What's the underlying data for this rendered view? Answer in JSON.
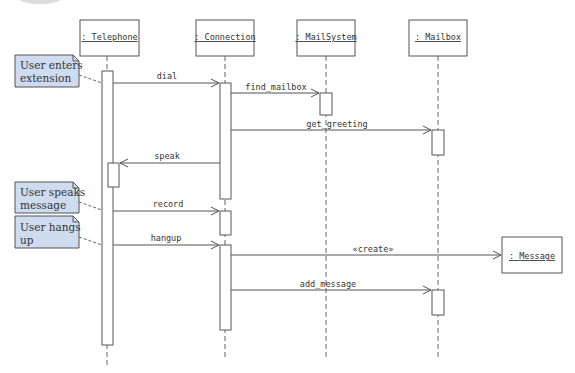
{
  "diagram": {
    "type": "UML sequence diagram",
    "objects": [
      {
        "id": "telephone",
        "label": ": Telephone"
      },
      {
        "id": "connection",
        "label": ": Connection"
      },
      {
        "id": "mailsystem",
        "label": ": MailSystem"
      },
      {
        "id": "mailbox",
        "label": ": Mailbox"
      },
      {
        "id": "message",
        "label": ": Message"
      }
    ],
    "messages": [
      {
        "label": "dial",
        "from": "telephone",
        "to": "connection"
      },
      {
        "label": "find_mailbox",
        "from": "connection",
        "to": "mailsystem"
      },
      {
        "label": "get_greeting",
        "from": "connection",
        "to": "mailbox"
      },
      {
        "label": "speak",
        "from": "connection",
        "to": "telephone"
      },
      {
        "label": "record",
        "from": "telephone",
        "to": "connection"
      },
      {
        "label": "hangup",
        "from": "telephone",
        "to": "connection"
      },
      {
        "label": "«create»",
        "from": "connection",
        "to": "message"
      },
      {
        "label": "add_message",
        "from": "connection",
        "to": "mailbox"
      }
    ],
    "notes": [
      {
        "lines": [
          "User enters",
          "extension"
        ],
        "attached_to": "dial"
      },
      {
        "lines": [
          "User speaks",
          "message"
        ],
        "attached_to": "record"
      },
      {
        "lines": [
          "User hangs",
          "up"
        ],
        "attached_to": "hangup"
      }
    ],
    "colors": {
      "note_fill": "#cfdcef",
      "line": "#555555",
      "background": "#ffffff"
    }
  }
}
